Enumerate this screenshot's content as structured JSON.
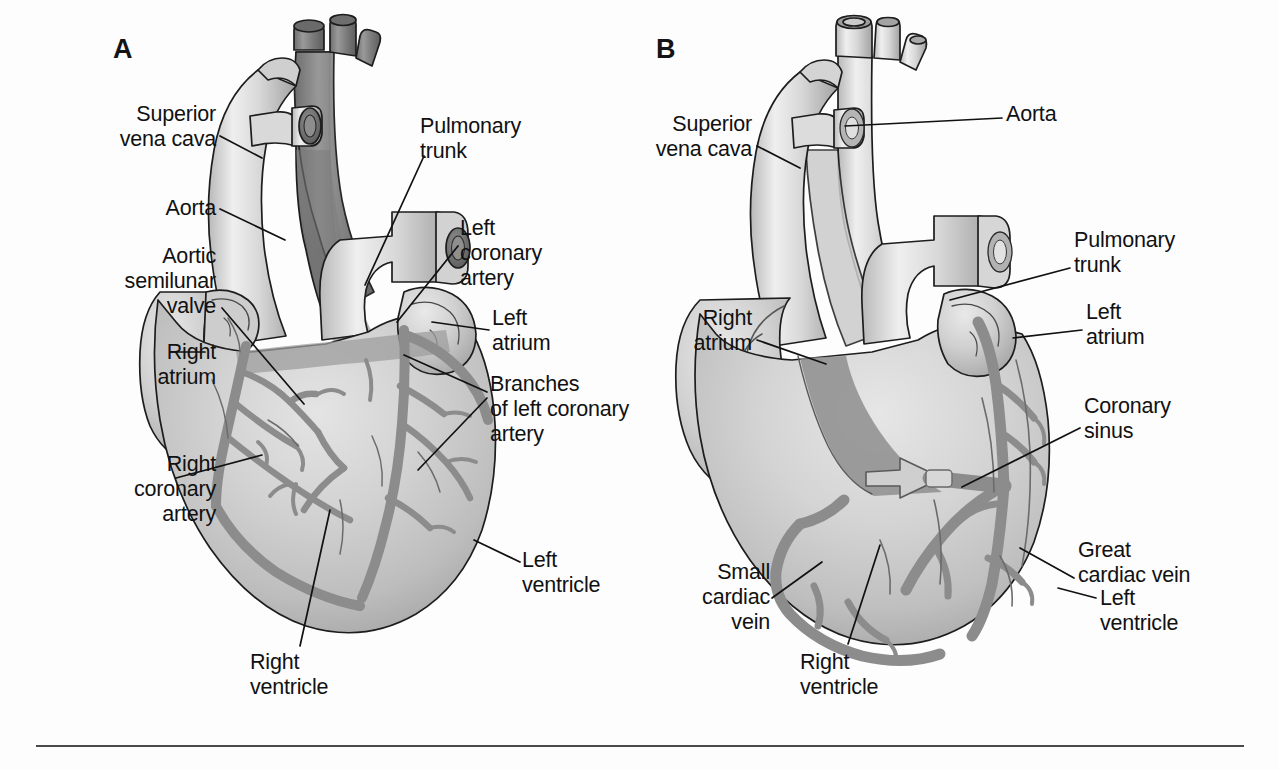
{
  "figure": {
    "background_color": "#fdfdfd",
    "ink_color": "#111111",
    "rule_color": "#4a4a4a"
  },
  "panels": [
    {
      "id": "A",
      "letter": "A",
      "letter_pos": {
        "x": 113,
        "y": 34
      },
      "view": "anterior",
      "labels": [
        {
          "key": "superior-vena-cava",
          "text": "Superior\nvena cava",
          "x": 64,
          "y": 102,
          "align": "right",
          "width": 152,
          "leader": [
            [
              220,
              136
            ],
            [
              262,
              158
            ]
          ]
        },
        {
          "key": "aorta",
          "text": "Aorta",
          "x": 64,
          "y": 196,
          "align": "right",
          "width": 152,
          "leader": [
            [
              220,
              209
            ],
            [
              285,
              240
            ]
          ]
        },
        {
          "key": "aortic-semilunar-valve",
          "text": "Aortic\nsemilunar\nvalve",
          "x": 44,
          "y": 244,
          "align": "right",
          "width": 172,
          "leader": [
            [
              222,
              308
            ],
            [
              304,
              404
            ]
          ]
        },
        {
          "key": "right-atrium",
          "text": "Right\natrium",
          "x": 64,
          "y": 340,
          "align": "right",
          "width": 152,
          "leader": [
            [
              170,
              352
            ],
            [
              205,
              352
            ]
          ]
        },
        {
          "key": "right-coronary-artery",
          "text": "Right\ncoronary\nartery",
          "x": 56,
          "y": 452,
          "align": "right",
          "width": 160,
          "leader": [
            [
              176,
              478
            ],
            [
              262,
              455
            ]
          ]
        },
        {
          "key": "pulmonary-trunk",
          "text": "Pulmonary\ntrunk",
          "x": 420,
          "y": 114,
          "align": "left",
          "width": 170,
          "leader": [
            [
              424,
              156
            ],
            [
              365,
              285
            ]
          ]
        },
        {
          "key": "left-coronary-artery",
          "text": "Left\ncoronary\nartery",
          "x": 460,
          "y": 216,
          "align": "left",
          "width": 150,
          "leader": [
            [
              458,
              246
            ],
            [
              397,
              322
            ]
          ]
        },
        {
          "key": "left-atrium",
          "text": "Left\natrium",
          "x": 492,
          "y": 306,
          "align": "left",
          "width": 120,
          "leader": [
            [
              489,
              330
            ],
            [
              432,
              322
            ]
          ]
        },
        {
          "key": "branches-of-left-coronary-artery",
          "text": "Branches\nof left coronary\nartery",
          "x": 490,
          "y": 372,
          "align": "left",
          "width": 210,
          "leader": [
            [
              487,
              392
            ],
            [
              404,
              355
            ]
          ],
          "leader2": [
            [
              487,
              398
            ],
            [
              418,
              470
            ]
          ]
        },
        {
          "key": "left-ventricle",
          "text": "Left\nventricle",
          "x": 522,
          "y": 548,
          "align": "left",
          "width": 140,
          "leader": [
            [
              520,
              562
            ],
            [
              474,
              540
            ]
          ]
        },
        {
          "key": "right-ventricle",
          "text": "Right\nventricle",
          "x": 250,
          "y": 650,
          "align": "left",
          "width": 140,
          "leader": [
            [
              300,
              646
            ],
            [
              330,
              510
            ]
          ]
        }
      ]
    },
    {
      "id": "B",
      "letter": "B",
      "letter_pos": {
        "x": 656,
        "y": 34
      },
      "view": "posterior",
      "labels": [
        {
          "key": "superior-vena-cava",
          "text": "Superior\nvena cava",
          "x": 600,
          "y": 112,
          "align": "right",
          "width": 152,
          "leader": [
            [
              757,
              146
            ],
            [
              800,
              168
            ]
          ]
        },
        {
          "key": "right-atrium",
          "text": "Right\natrium",
          "x": 600,
          "y": 306,
          "align": "right",
          "width": 152,
          "leader": [
            [
              757,
              340
            ],
            [
              826,
              364
            ]
          ]
        },
        {
          "key": "small-cardiac-vein",
          "text": "Small\ncardiac\nvein",
          "x": 620,
          "y": 560,
          "align": "right",
          "width": 150,
          "leader": [
            [
              772,
              598
            ],
            [
              822,
              562
            ]
          ]
        },
        {
          "key": "right-ventricle",
          "text": "Right\nventricle",
          "x": 800,
          "y": 650,
          "align": "left",
          "width": 140,
          "leader": [
            [
              848,
              644
            ],
            [
              880,
              545
            ]
          ]
        },
        {
          "key": "aorta",
          "text": "Aorta",
          "x": 1006,
          "y": 102,
          "align": "left",
          "width": 120,
          "leader": [
            [
              1002,
              118
            ],
            [
              845,
              126
            ]
          ]
        },
        {
          "key": "pulmonary-trunk",
          "text": "Pulmonary\ntrunk",
          "x": 1074,
          "y": 228,
          "align": "left",
          "width": 170,
          "leader": [
            [
              1070,
              268
            ],
            [
              950,
              300
            ]
          ]
        },
        {
          "key": "left-atrium",
          "text": "Left\natrium",
          "x": 1086,
          "y": 300,
          "align": "left",
          "width": 130,
          "leader": [
            [
              1082,
              330
            ],
            [
              1013,
              338
            ]
          ]
        },
        {
          "key": "coronary-sinus",
          "text": "Coronary\nsinus",
          "x": 1084,
          "y": 394,
          "align": "left",
          "width": 160,
          "leader": [
            [
              1080,
              428
            ],
            [
              962,
              487
            ]
          ]
        },
        {
          "key": "great-cardiac-vein",
          "text": "Great\ncardiac vein",
          "x": 1078,
          "y": 538,
          "align": "left",
          "width": 186,
          "leader": [
            [
              1074,
              578
            ],
            [
              1020,
              548
            ]
          ]
        },
        {
          "key": "left-ventricle",
          "text": "Left\nventricle",
          "x": 1100,
          "y": 586,
          "align": "left",
          "width": 140,
          "leader": [
            [
              1096,
              598
            ],
            [
              1058,
              588
            ]
          ]
        }
      ]
    }
  ],
  "rule": {
    "x": 36,
    "y": 745,
    "width": 1208,
    "height": 2
  }
}
